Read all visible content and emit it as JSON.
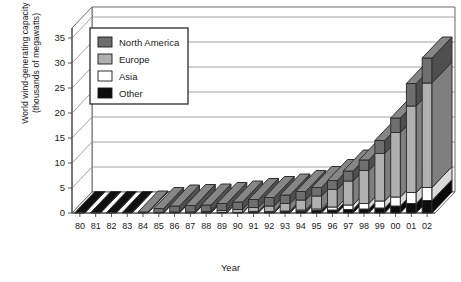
{
  "chart_data": {
    "type": "bar",
    "subtype": "stacked-3d-column",
    "title": "",
    "xlabel": "Year",
    "ylabel": "World wind-generating capacity (thousands of megawatts)",
    "ylabel_line1": "World wind-generating capacity",
    "ylabel_line2": "(thousands of megawatts)",
    "ylim": [
      0,
      37
    ],
    "yticks": [
      0,
      5,
      10,
      15,
      20,
      25,
      30,
      35
    ],
    "ytick_labels": [
      "0",
      "5",
      "10",
      "15",
      "20",
      "25",
      "30",
      "35"
    ],
    "grid": true,
    "legend_position": "upper-left-inside",
    "categories": [
      "80",
      "81",
      "82",
      "83",
      "84",
      "85",
      "86",
      "87",
      "88",
      "89",
      "90",
      "91",
      "92",
      "93",
      "94",
      "95",
      "96",
      "97",
      "98",
      "99",
      "00",
      "01",
      "02"
    ],
    "series": [
      {
        "name": "North America",
        "color": "#6e6e6e",
        "values": [
          0.0,
          0.0,
          0.0,
          0.0,
          0.1,
          0.8,
          1.2,
          1.3,
          1.3,
          1.4,
          1.5,
          1.6,
          1.7,
          1.7,
          1.7,
          1.7,
          1.8,
          2.0,
          2.1,
          2.6,
          2.9,
          4.5,
          5.0
        ]
      },
      {
        "name": "Europe",
        "color": "#b0b0b0",
        "values": [
          0.0,
          0.0,
          0.0,
          0.0,
          0.0,
          0.0,
          0.1,
          0.1,
          0.2,
          0.4,
          0.6,
          0.8,
          1.1,
          1.5,
          2.0,
          2.6,
          3.5,
          4.8,
          6.6,
          9.5,
          12.9,
          17.3,
          20.9
        ]
      },
      {
        "name": "Asia",
        "color": "#ffffff",
        "values": [
          0.0,
          0.0,
          0.0,
          0.0,
          0.0,
          0.0,
          0.0,
          0.0,
          0.0,
          0.0,
          0.0,
          0.1,
          0.1,
          0.1,
          0.2,
          0.3,
          0.6,
          0.9,
          1.1,
          1.4,
          1.8,
          2.2,
          2.6
        ]
      },
      {
        "name": "Other",
        "color": "#0d0d0d",
        "values": [
          0.1,
          0.1,
          0.1,
          0.1,
          0.1,
          0.1,
          0.1,
          0.1,
          0.1,
          0.1,
          0.1,
          0.2,
          0.2,
          0.3,
          0.4,
          0.5,
          0.6,
          0.7,
          0.8,
          1.0,
          1.4,
          1.9,
          2.5
        ]
      }
    ],
    "totals": [
      0.1,
      0.1,
      0.1,
      0.1,
      0.2,
      0.9,
      1.4,
      1.5,
      1.6,
      1.9,
      2.2,
      2.7,
      3.1,
      3.6,
      4.3,
      5.1,
      6.5,
      8.4,
      10.6,
      14.5,
      19.0,
      25.9,
      31.0
    ]
  },
  "legend": {
    "items": [
      {
        "label": "North America",
        "swatch": "#6e6e6e"
      },
      {
        "label": "Europe",
        "swatch": "#b0b0b0"
      },
      {
        "label": "Asia",
        "swatch": "#ffffff"
      },
      {
        "label": "Other",
        "swatch": "#0d0d0d"
      }
    ]
  },
  "colors": {
    "north_america": "#6e6e6e",
    "europe": "#b0b0b0",
    "asia": "#ffffff",
    "other": "#0d0d0d",
    "axis": "#555555",
    "grid": "#8a8a8a",
    "background": "#ffffff"
  }
}
